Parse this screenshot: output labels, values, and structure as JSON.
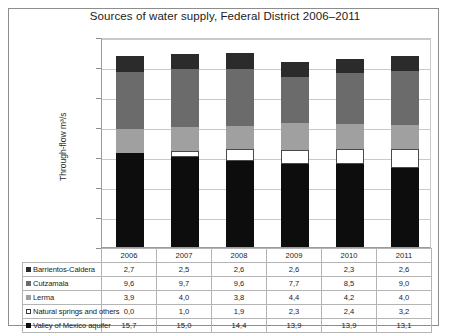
{
  "chart_data": {
    "type": "bar",
    "subtype": "stacked-column",
    "title": "Sources of water supply, Federal District 2006–2011",
    "xlabel": "",
    "ylabel": "Through-flow m³/s",
    "categories": [
      "2006",
      "2007",
      "2008",
      "2009",
      "2010",
      "2011"
    ],
    "ylim": [
      0,
      35
    ],
    "ytick_step": 5,
    "ytick_labels": [
      "0",
      "5",
      "10",
      "15",
      "20",
      "25",
      "30",
      "35"
    ],
    "grid": true,
    "legend_position": "table-row-labels",
    "decimal_separator": ",",
    "stack_order_bottom_to_top": [
      "Valley of Mexico aquifer",
      "Natural springs and others",
      "Lerma",
      "Cutzamala",
      "Barrientos-Caldera"
    ],
    "series": [
      {
        "name": "Barrientos-Caldera",
        "color": "#2b2b2b",
        "marker": "filled-square",
        "values": [
          2.7,
          2.5,
          2.6,
          2.6,
          2.3,
          2.6
        ],
        "labels": [
          "2,7",
          "2,5",
          "2,6",
          "2,6",
          "2,3",
          "2,6"
        ]
      },
      {
        "name": "Cutzamala",
        "color": "#6b6b6b",
        "marker": "filled-square",
        "values": [
          9.6,
          9.7,
          9.6,
          7.7,
          8.5,
          9.0
        ],
        "labels": [
          "9,6",
          "9,7",
          "9,6",
          "7,7",
          "8,5",
          "9,0"
        ]
      },
      {
        "name": "Lerma",
        "color": "#a0a0a0",
        "marker": "filled-square",
        "values": [
          3.9,
          4.0,
          3.8,
          4.4,
          4.2,
          4.0
        ],
        "labels": [
          "3,9",
          "4,0",
          "3,8",
          "4,4",
          "4,2",
          "4,0"
        ]
      },
      {
        "name": "Natural springs and others",
        "color": "#ffffff",
        "marker": "outlined-square",
        "values": [
          0.0,
          1.0,
          1.9,
          2.3,
          2.4,
          3.2
        ],
        "labels": [
          "0,0",
          "1,0",
          "1,9",
          "2,3",
          "2,4",
          "3,2"
        ]
      },
      {
        "name": "Valley of Mexico aquifer",
        "color": "#0d0d0d",
        "marker": "filled-square",
        "values": [
          15.7,
          15.0,
          14.4,
          13.9,
          13.9,
          13.1
        ],
        "labels": [
          "15,7",
          "15,0",
          "14,4",
          "13,9",
          "13,9",
          "13,1"
        ]
      }
    ],
    "totals": [
      31.9,
      32.2,
      32.3,
      30.9,
      31.3,
      31.9
    ]
  },
  "colors": {
    "frame": "#8d8d8d",
    "gridline": "#c9c9c9",
    "text": "#1b1b1b",
    "table_border": "#b4b4b4",
    "background": "#ffffff"
  }
}
